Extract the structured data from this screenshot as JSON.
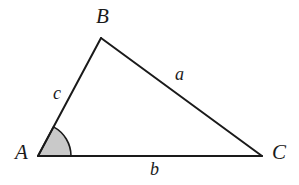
{
  "figure": {
    "type": "geometry-diagram",
    "background_color": "#ffffff",
    "stroke_color": "#1a1a1a",
    "angle_fill_color": "#c9c9c9",
    "vertices": [
      {
        "name": "A",
        "label": "A",
        "x": 38,
        "y": 156
      },
      {
        "name": "B",
        "label": "B",
        "x": 101,
        "y": 38
      },
      {
        "name": "C",
        "label": "C",
        "x": 262,
        "y": 156
      }
    ],
    "sides": [
      {
        "name": "a",
        "label": "a",
        "from": "B",
        "to": "C"
      },
      {
        "name": "b",
        "label": "b",
        "from": "A",
        "to": "C"
      },
      {
        "name": "c",
        "label": "c",
        "from": "A",
        "to": "B"
      }
    ],
    "angle_marker": {
      "at_vertex": "A",
      "radius": 33,
      "start_angle_deg": 0,
      "end_angle_deg": 62,
      "filled": true
    }
  }
}
